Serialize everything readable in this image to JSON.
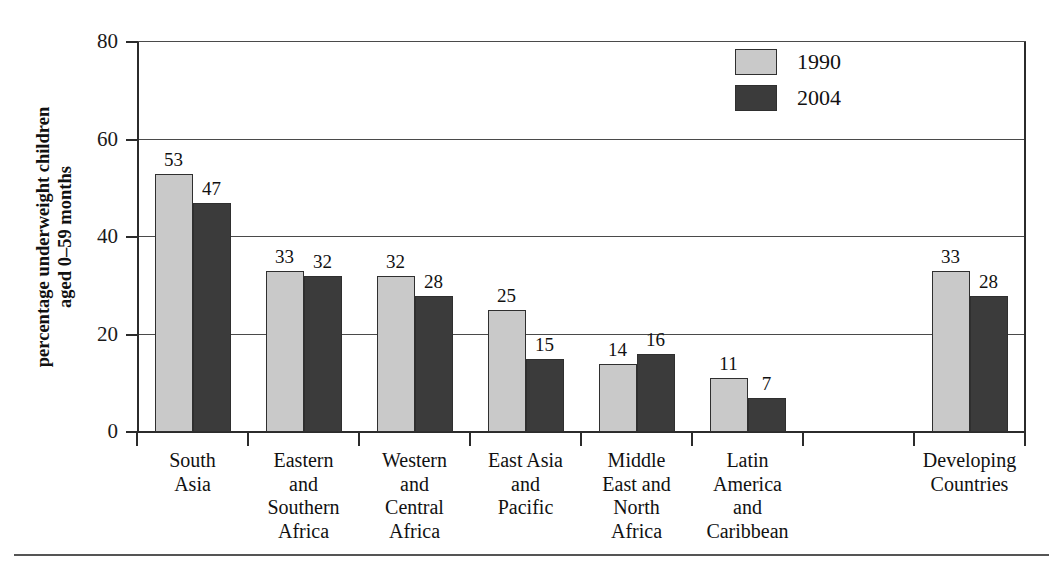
{
  "chart_data": {
    "type": "bar",
    "title": "",
    "xlabel": "",
    "ylabel": "percentage underweight children aged 0–59 months",
    "ylim": [
      0,
      80
    ],
    "yticks": [
      0,
      20,
      40,
      60,
      80
    ],
    "grid": true,
    "legend_position": "top-right",
    "categories": [
      "South Asia",
      "Eastern and Southern Africa",
      "Western and Central Africa",
      "East Asia and Pacific",
      "Middle East and North Africa",
      "Latin America and Caribbean",
      "",
      "Developing Countries"
    ],
    "category_lines": [
      [
        "South",
        "Asia"
      ],
      [
        "Eastern",
        "and",
        "Southern",
        "Africa"
      ],
      [
        "Western",
        "and",
        "Central",
        "Africa"
      ],
      [
        "East Asia",
        "and",
        "Pacific"
      ],
      [
        "Middle",
        "East and",
        "North",
        "Africa"
      ],
      [
        "Latin",
        "America",
        "and",
        "Caribbean"
      ],
      [],
      [
        "Developing",
        "Countries"
      ]
    ],
    "series": [
      {
        "name": "1990",
        "color": "#c9c9c9",
        "values": [
          53,
          33,
          32,
          25,
          14,
          11,
          null,
          33
        ]
      },
      {
        "name": "2004",
        "color": "#3b3b3b",
        "values": [
          47,
          32,
          28,
          15,
          16,
          7,
          null,
          28
        ]
      }
    ]
  },
  "legend": {
    "items": [
      {
        "label": "1990",
        "color": "#c9c9c9"
      },
      {
        "label": "2004",
        "color": "#3b3b3b"
      }
    ]
  },
  "axis": {
    "y_title": "percentage underweight children aged 0–59 months",
    "y_title_line1": "percentage underweight children",
    "y_title_line2": "aged 0–59 months",
    "y_ticks": [
      "0",
      "20",
      "40",
      "60",
      "80"
    ]
  },
  "colors": {
    "series_1990": "#c9c9c9",
    "series_2004": "#3b3b3b",
    "axis": "#2b2b2b",
    "grid": "#4a4a4a",
    "text": "#111111",
    "background": "#ffffff"
  }
}
